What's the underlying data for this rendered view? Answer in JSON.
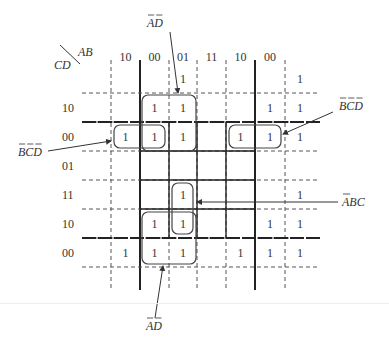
{
  "corner": {
    "col_var": "AB",
    "row_var": "CD"
  },
  "columns": {
    "labels": [
      "10",
      "00",
      "01",
      "11",
      "10",
      "00",
      ""
    ],
    "x_edges": [
      111,
      140,
      169,
      197,
      226,
      255,
      285,
      315
    ]
  },
  "rows": {
    "labels": [
      "",
      "10",
      "00",
      "01",
      "11",
      "10",
      "00"
    ],
    "y_edges": [
      65,
      93,
      122,
      151,
      180,
      209,
      238,
      267
    ]
  },
  "cells": [
    [
      "",
      "",
      "1",
      "",
      "",
      "",
      "1"
    ],
    [
      "",
      "1",
      "1",
      "",
      "",
      "1",
      "1"
    ],
    [
      "1",
      "1",
      "1",
      "",
      "1",
      "1",
      "1"
    ],
    [
      "",
      "",
      "",
      "",
      "",
      "",
      ""
    ],
    [
      "",
      "",
      "1",
      "",
      "",
      "",
      "1"
    ],
    [
      "",
      "1",
      "1",
      "",
      "",
      "1",
      "1"
    ],
    [
      "1",
      "1",
      "1",
      "",
      "1",
      "1",
      "1"
    ]
  ],
  "groups": [
    {
      "name": "top-AD-group",
      "x": 142,
      "y": 95,
      "w": 54,
      "h": 56
    },
    {
      "name": "left-BCD-group",
      "x": 114,
      "y": 125,
      "w": 51,
      "h": 23
    },
    {
      "name": "center-ABC-group",
      "x": 172,
      "y": 183,
      "w": 21,
      "h": 51
    },
    {
      "name": "bottom-AD-group",
      "x": 142,
      "y": 212,
      "w": 54,
      "h": 52
    },
    {
      "name": "right-BCD-group",
      "x": 229,
      "y": 125,
      "w": 52,
      "h": 23
    }
  ],
  "annotations": [
    {
      "name": "label-ad-top",
      "text": "AD",
      "overbar": "AD",
      "x": 147,
      "y": 27,
      "arrow": {
        "x1": 170,
        "y1": 32,
        "x2": 178,
        "y2": 93
      }
    },
    {
      "name": "label-bcd-right",
      "text": "BCD",
      "overbar": "BCD",
      "x": 339,
      "y": 110,
      "arrow": {
        "x1": 333,
        "y1": 112,
        "x2": 283,
        "y2": 134
      }
    },
    {
      "name": "label-bcd-left",
      "text": "BCD",
      "overbar": "BCD",
      "x": 18,
      "y": 156,
      "arrow": {
        "x1": 48,
        "y1": 151,
        "x2": 111,
        "y2": 141
      }
    },
    {
      "name": "label-abc",
      "text": "ABC",
      "overbar": "A",
      "x": 342,
      "y": 206,
      "arrow": {
        "x1": 338,
        "y1": 202,
        "x2": 197,
        "y2": 202
      }
    },
    {
      "name": "label-ad-bottom",
      "text": "AD",
      "overbar": "AD",
      "x": 146,
      "y": 330,
      "arrow": {
        "x1": 155,
        "y1": 318,
        "x2": 163,
        "y2": 266
      }
    }
  ]
}
